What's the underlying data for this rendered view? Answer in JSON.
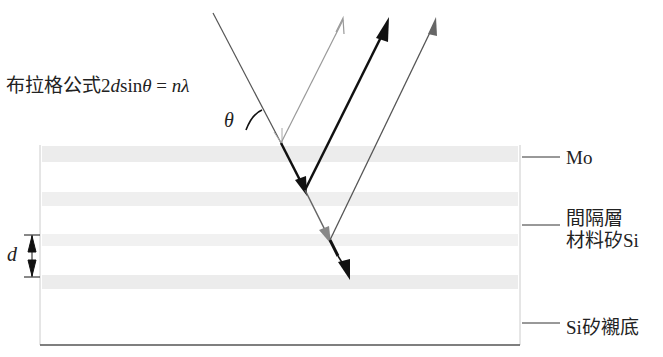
{
  "diagram": {
    "formula": {
      "prefix": "布拉格公式",
      "two": "2",
      "d": "d",
      "sin": "sin",
      "theta": "θ",
      "equals": " = ",
      "n": "n",
      "lambda": "λ"
    },
    "angle_label": "θ",
    "spacing_label": "d",
    "labels": {
      "mo": "Mo",
      "spacer_line1": "間隔層",
      "spacer_line2": "材料矽Si",
      "substrate": "Si矽襯底"
    },
    "colors": {
      "line_dark": "#111111",
      "line_mid": "#666666",
      "line_light": "#9a9a9a",
      "layer_band": "#ececec",
      "box_edge": "#bbbbbb"
    }
  }
}
